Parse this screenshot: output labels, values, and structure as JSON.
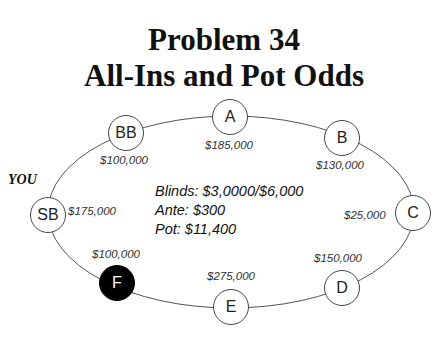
{
  "title": {
    "line1": "Problem 34",
    "line2": "All-Ins and Pot Odds"
  },
  "you_label": "YOU",
  "info": {
    "blinds": "Blinds: $3,0000/$6,000",
    "ante": "Ante: $300",
    "pot": "Pot: $11,400"
  },
  "seats": [
    {
      "id": "A",
      "label": "A",
      "stack": "$185,000",
      "highlighted": false
    },
    {
      "id": "B",
      "label": "B",
      "stack": "$130,000",
      "highlighted": false
    },
    {
      "id": "C",
      "label": "C",
      "stack": "$25,000",
      "highlighted": false
    },
    {
      "id": "D",
      "label": "D",
      "stack": "$150,000",
      "highlighted": false
    },
    {
      "id": "E",
      "label": "E",
      "stack": "$275,000",
      "highlighted": false
    },
    {
      "id": "F",
      "label": "F",
      "stack": "$100,000",
      "highlighted": true
    },
    {
      "id": "SB",
      "label": "SB",
      "stack": "$175,000",
      "highlighted": false
    },
    {
      "id": "BB",
      "label": "BB",
      "stack": "$100,000",
      "highlighted": false
    }
  ],
  "colors": {
    "highlight_seat": "#000000",
    "seat_border": "#444444",
    "table_line": "#555555"
  }
}
